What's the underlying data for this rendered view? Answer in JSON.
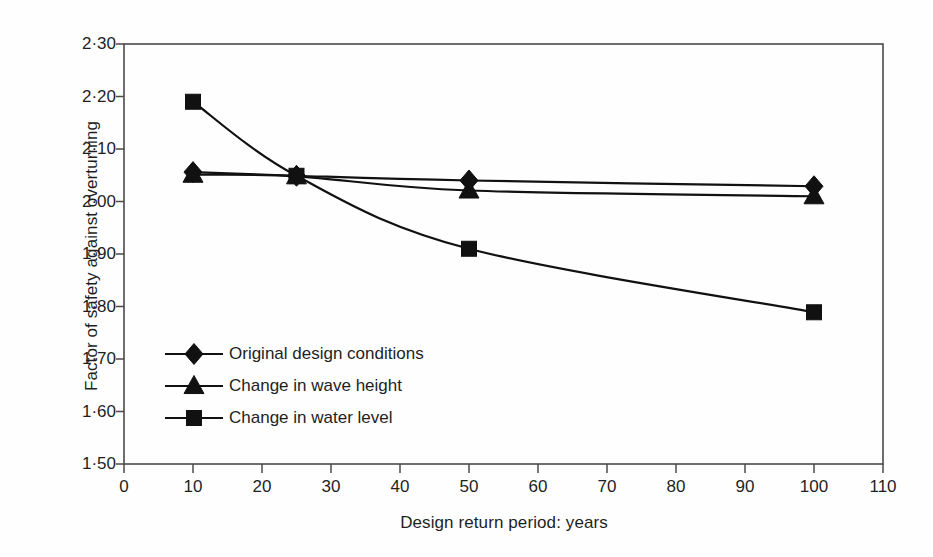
{
  "chart_data": {
    "type": "line",
    "title": "",
    "xlabel": "Design return period: years",
    "ylabel": "Factor of safety against overturning",
    "xlim": [
      0,
      110
    ],
    "ylim": [
      1.5,
      2.3
    ],
    "xticks": [
      "0",
      "10",
      "20",
      "30",
      "40",
      "50",
      "60",
      "70",
      "80",
      "90",
      "100",
      "110"
    ],
    "xtick_values": [
      0,
      10,
      20,
      30,
      40,
      50,
      60,
      70,
      80,
      90,
      100,
      110
    ],
    "yticks": [
      "1·50",
      "1·60",
      "1·70",
      "1·80",
      "1·90",
      "2·00",
      "2·10",
      "2·20",
      "2·30"
    ],
    "ytick_values": [
      1.5,
      1.6,
      1.7,
      1.8,
      1.9,
      2.0,
      2.1,
      2.2,
      2.3
    ],
    "grid": false,
    "legend_position": "lower-left-inside",
    "x": [
      10,
      25,
      50,
      100
    ],
    "series": [
      {
        "name": "Original design conditions",
        "marker": "diamond",
        "color": "#111111",
        "values": [
          2.056,
          2.049,
          2.04,
          2.029
        ]
      },
      {
        "name": "Change in wave height",
        "marker": "triangle",
        "color": "#111111",
        "values": [
          2.051,
          2.048,
          2.021,
          2.01
        ]
      },
      {
        "name": "Change in water level",
        "marker": "square",
        "color": "#111111",
        "values": [
          2.19,
          2.049,
          1.91,
          1.789
        ]
      }
    ]
  },
  "axes": {
    "frame_color": "#4a4a4a",
    "line_color": "#111111"
  },
  "legend": {
    "items": [
      {
        "label": "Original design conditions",
        "marker": "diamond"
      },
      {
        "label": "Change in wave height",
        "marker": "triangle"
      },
      {
        "label": "Change in water level",
        "marker": "square"
      }
    ]
  }
}
